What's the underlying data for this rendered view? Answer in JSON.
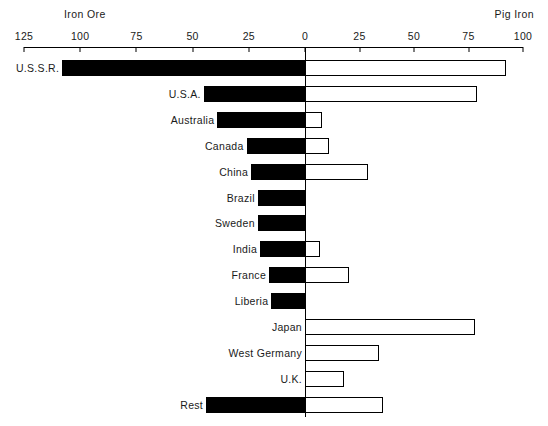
{
  "chart_data": {
    "type": "bar",
    "orientation": "horizontal",
    "subtype": "diverging-bidirectional",
    "title": "",
    "left_title": "Iron Ore",
    "right_title": "Pig Iron",
    "categories": [
      "U.S.S.R.",
      "U.S.A.",
      "Australia",
      "Canada",
      "China",
      "Brazil",
      "Sweden",
      "India",
      "France",
      "Liberia",
      "Japan",
      "West Germany",
      "U.K.",
      "Rest"
    ],
    "series": [
      {
        "name": "Iron Ore",
        "side": "left",
        "color": "#000000",
        "values": [
          108,
          45,
          39,
          26,
          24,
          21,
          21,
          20,
          16,
          15,
          0,
          0,
          0,
          44
        ]
      },
      {
        "name": "Pig Iron",
        "side": "right",
        "color": "#ffffff",
        "values": [
          92,
          79,
          8,
          11,
          29,
          0,
          0,
          7,
          20,
          0,
          78,
          34,
          18,
          36
        ]
      }
    ],
    "left_axis": {
      "label": "Iron Ore",
      "ticks": [
        125,
        100,
        75,
        50,
        25,
        0
      ],
      "min": 0,
      "max": 125
    },
    "right_axis": {
      "label": "Pig Iron",
      "ticks": [
        0,
        25,
        50,
        75,
        100
      ],
      "min": 0,
      "max": 100
    },
    "grid": false,
    "legend": "none",
    "axis_position": "top"
  },
  "geometry": {
    "zero_x": 305,
    "left_end_x": 24,
    "right_end_x": 523,
    "axis_y": 47,
    "first_row_y": 60,
    "row_step": 25.9,
    "bar_height": 16
  }
}
